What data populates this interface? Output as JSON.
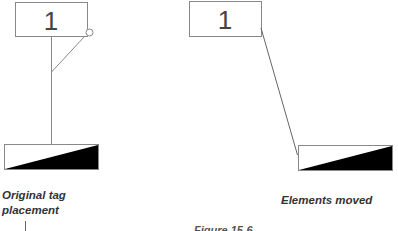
{
  "left_panel": {
    "tag_label": "1",
    "caption_line1": "Original tag",
    "caption_line2": "placement"
  },
  "right_panel": {
    "tag_label": "1",
    "caption": "Elements moved"
  },
  "figure_caption": "Figure 15-6",
  "colors": {
    "stroke": "#777777",
    "fill_dark": "#000000",
    "background": "#ffffff"
  }
}
